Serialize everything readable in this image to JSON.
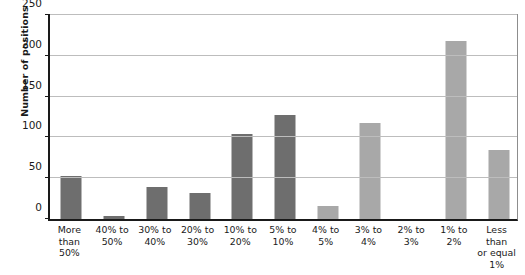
{
  "chart_data": {
    "type": "bar",
    "title": "",
    "xlabel": "",
    "ylabel": "Number of positions",
    "ylim": [
      0,
      250
    ],
    "yticks": [
      0,
      50,
      100,
      150,
      200,
      250
    ],
    "grid": true,
    "legend": "none",
    "categories": [
      "More than 50%",
      "40% to 50%",
      "30% to 40%",
      "20% to 30%",
      "10% to 20%",
      "5% to 10%",
      "4% to 5%",
      "3% to 4%",
      "2% to 3%",
      "1% to 2%",
      "Less than or equal 1%"
    ],
    "category_lines": [
      [
        "More",
        "than",
        "50%"
      ],
      [
        "40% to",
        "50%"
      ],
      [
        "30% to",
        "40%"
      ],
      [
        "20% to",
        "30%"
      ],
      [
        "10% to",
        "20%"
      ],
      [
        "5% to",
        "10%"
      ],
      [
        "4% to",
        "5%"
      ],
      [
        "3% to",
        "4%"
      ],
      [
        "2% to",
        "3%"
      ],
      [
        "1% to",
        "2%"
      ],
      [
        "Less than",
        "or equal",
        "1%"
      ]
    ],
    "values": [
      53,
      4,
      39,
      32,
      104,
      127,
      16,
      118,
      0,
      218,
      84
    ],
    "bar_colors": [
      "#6e6e6e",
      "#6e6e6e",
      "#6e6e6e",
      "#6e6e6e",
      "#6e6e6e",
      "#6e6e6e",
      "#a8a8a8",
      "#a8a8a8",
      "#a8a8a8",
      "#a8a8a8",
      "#a8a8a8"
    ]
  },
  "colors": {
    "dark_bar": "#6e6e6e",
    "light_bar": "#a8a8a8",
    "axis": "#1a1a1a",
    "gridline": "#bdbdbd",
    "background": "#ffffff"
  }
}
